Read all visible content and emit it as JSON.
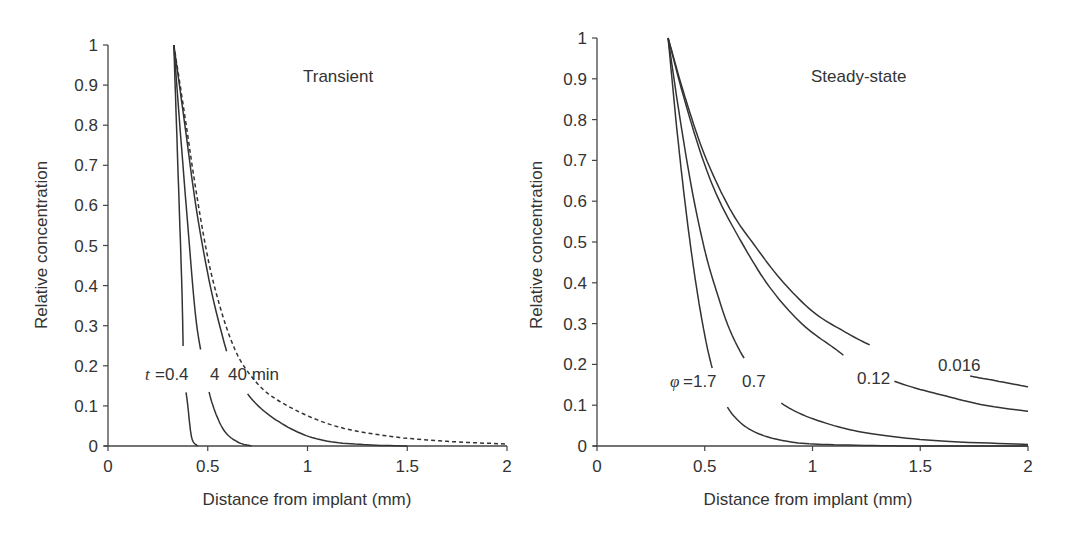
{
  "chart_data": [
    {
      "type": "line",
      "title": "Transient",
      "xlabel": "Distance from implant (mm)",
      "ylabel": "Relative concentration",
      "xlim": [
        0,
        2
      ],
      "ylim": [
        0,
        1
      ],
      "xticks": [
        "0",
        "0.5",
        "1",
        "1.5",
        "2"
      ],
      "yticks": [
        "0",
        "0.1",
        "0.2",
        "0.3",
        "0.4",
        "0.5",
        "0.6",
        "0.7",
        "0.8",
        "0.9",
        "1"
      ],
      "grid": false,
      "annotation": {
        "prefix": "t",
        "text": "=0.4   4 40 min"
      },
      "series": [
        {
          "name": "t = 0.4 min",
          "style": "solid",
          "x": [
            0.33,
            0.35,
            0.37,
            0.38,
            0.4,
            0.42,
            0.45
          ],
          "y": [
            1.0,
            0.7,
            0.4,
            0.2,
            0.1,
            0.02,
            0.0
          ]
        },
        {
          "name": "t = 4 min",
          "style": "solid",
          "x": [
            0.33,
            0.36,
            0.4,
            0.44,
            0.48,
            0.52,
            0.58,
            0.65,
            0.72
          ],
          "y": [
            1.0,
            0.8,
            0.55,
            0.32,
            0.2,
            0.11,
            0.04,
            0.01,
            0.0
          ]
        },
        {
          "name": "t = 40 min",
          "style": "solid",
          "x": [
            0.33,
            0.38,
            0.44,
            0.5,
            0.56,
            0.62,
            0.7,
            0.8,
            0.95,
            1.1,
            1.3,
            1.5
          ],
          "y": [
            1.0,
            0.82,
            0.6,
            0.43,
            0.3,
            0.2,
            0.13,
            0.08,
            0.035,
            0.012,
            0.003,
            0.0
          ]
        },
        {
          "name": "steady-state",
          "style": "dashed",
          "x": [
            0.33,
            0.38,
            0.44,
            0.5,
            0.56,
            0.62,
            0.68,
            0.78,
            0.9,
            1.05,
            1.2,
            1.4,
            1.6,
            1.8,
            2.0
          ],
          "y": [
            1.0,
            0.84,
            0.64,
            0.47,
            0.35,
            0.26,
            0.2,
            0.14,
            0.1,
            0.065,
            0.042,
            0.025,
            0.015,
            0.009,
            0.005
          ]
        }
      ]
    },
    {
      "type": "line",
      "title": "Steady-state",
      "xlabel": "Distance from implant (mm)",
      "ylabel": "Relative concentration",
      "xlim": [
        0,
        2
      ],
      "ylim": [
        0,
        1
      ],
      "xticks": [
        "0",
        "0.5",
        "1",
        "1.5",
        "2"
      ],
      "yticks": [
        "0",
        "0.1",
        "0.2",
        "0.3",
        "0.4",
        "0.5",
        "0.6",
        "0.7",
        "0.8",
        "0.9",
        "1"
      ],
      "grid": false,
      "annotation": {
        "prefix": "φ",
        "text": "=1.7  0.7"
      },
      "series": [
        {
          "name": "φ = 1.7",
          "style": "solid",
          "label": "1.7",
          "x": [
            0.33,
            0.37,
            0.41,
            0.45,
            0.49,
            0.53,
            0.58,
            0.65,
            0.75,
            0.9,
            1.1,
            1.5,
            2.0
          ],
          "y": [
            1.0,
            0.78,
            0.59,
            0.43,
            0.3,
            0.2,
            0.12,
            0.065,
            0.03,
            0.01,
            0.003,
            0.0,
            0.0
          ]
        },
        {
          "name": "φ = 0.7",
          "style": "solid",
          "label": "0.7",
          "x": [
            0.33,
            0.38,
            0.44,
            0.5,
            0.56,
            0.62,
            0.7,
            0.8,
            0.92,
            1.1,
            1.3,
            1.6,
            2.0
          ],
          "y": [
            1.0,
            0.82,
            0.63,
            0.48,
            0.37,
            0.28,
            0.2,
            0.13,
            0.085,
            0.05,
            0.028,
            0.012,
            0.004
          ]
        },
        {
          "name": "φ = 0.12",
          "style": "solid",
          "label": "0.12",
          "x": [
            0.33,
            0.4,
            0.48,
            0.56,
            0.67,
            0.8,
            0.95,
            1.1,
            1.21,
            1.4,
            1.6,
            1.8,
            2.0
          ],
          "y": [
            1.0,
            0.86,
            0.72,
            0.61,
            0.5,
            0.39,
            0.3,
            0.24,
            0.2,
            0.155,
            0.125,
            0.1,
            0.085
          ]
        },
        {
          "name": "φ = 0.016",
          "style": "solid",
          "label": "0.016",
          "x": [
            0.33,
            0.4,
            0.48,
            0.56,
            0.64,
            0.72,
            0.85,
            1.0,
            1.15,
            1.3,
            1.52,
            1.7,
            1.85,
            2.0
          ],
          "y": [
            1.0,
            0.87,
            0.74,
            0.64,
            0.56,
            0.5,
            0.41,
            0.33,
            0.28,
            0.24,
            0.2,
            0.175,
            0.16,
            0.145
          ]
        }
      ]
    }
  ],
  "panels": {
    "left": {
      "title": "Transient",
      "xlabel": "Distance from implant (mm)",
      "ylabel": "Relative concentration",
      "annotation_prefix": "t",
      "annotation_rest": "=0.4",
      "annotation_labels": [
        "4",
        "40 min"
      ]
    },
    "right": {
      "title": "Steady-state",
      "xlabel": "Distance from implant (mm)",
      "ylabel": "Relative concentration",
      "annotation_prefix": "φ",
      "annotation_rest": "=1.7",
      "annotation_labels": [
        "0.7",
        "0.12",
        "0.016"
      ]
    }
  }
}
